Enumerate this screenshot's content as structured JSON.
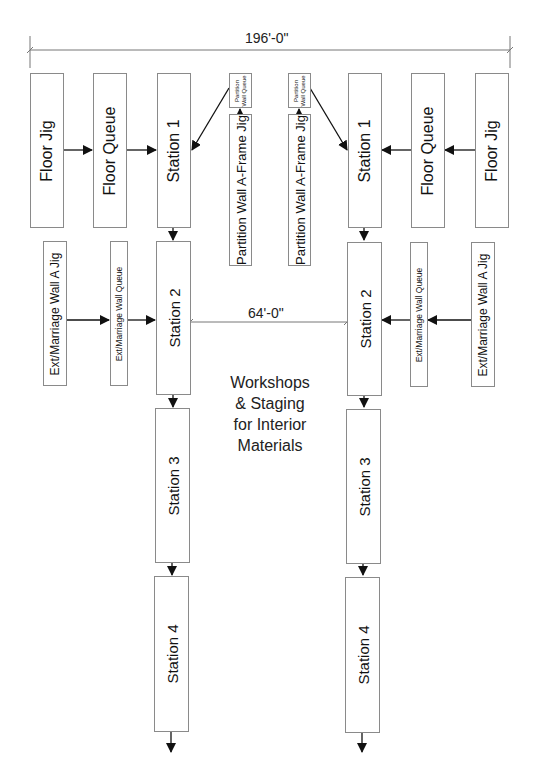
{
  "dimensions": {
    "overall_width": "196'-0\"",
    "line_spacing": "64'-0\""
  },
  "left_line": {
    "floor_jig": "Floor Jig",
    "floor_queue": "Floor Queue",
    "station_1": "Station 1",
    "partition_wall_queue": "Partition Wall Queue",
    "partition_wall_jig": "Partition Wall A-Frame Jig",
    "ext_wall_jig": "Ext/Marriage Wall A Jig",
    "ext_wall_queue": "Ext/Marriage Wall Queue",
    "station_2": "Station 2",
    "station_3": "Station 3",
    "station_4": "Station 4"
  },
  "right_line": {
    "floor_jig": "Floor Jig",
    "floor_queue": "Floor Queue",
    "station_1": "Station 1",
    "partition_wall_queue": "Partition Wall Queue",
    "partition_wall_jig": "Partition Wall A-Frame Jig",
    "ext_wall_jig": "Ext/Marriage Wall A Jig",
    "ext_wall_queue": "Ext/Marriage Wall Queue",
    "station_2": "Station 2",
    "station_3": "Station 3",
    "station_4": "Station 4"
  },
  "center_note": {
    "line1": "Workshops",
    "line2": "& Staging",
    "line3": "for Interior",
    "line4": "Materials"
  },
  "colors": {
    "box_border": "#8a8a8a",
    "arrow": "#111111",
    "dimension_line": "#777777"
  }
}
